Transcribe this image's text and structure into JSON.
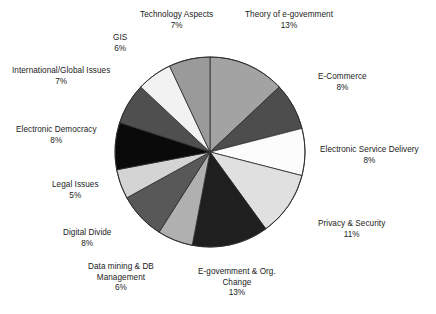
{
  "chart_data": {
    "type": "pie",
    "title": "",
    "subtitle": "",
    "xlabel": "",
    "ylabel": "",
    "legend_position": "none",
    "grid": false,
    "units": "percent",
    "start_angle_deg": 0,
    "direction": "clockwise",
    "categories": [
      "Theory of e-govemment",
      "E-Commerce",
      "Electronic Service Delivery",
      "Privacy & Security",
      "E-govemment & Org. Change",
      "Data mining & DB Management",
      "Digital Divide",
      "Legal Issues",
      "Electronic Democracy",
      "International/Global Issues",
      "GIS",
      "Technology Aspects"
    ],
    "values": [
      13,
      8,
      8,
      11,
      13,
      6,
      8,
      5,
      8,
      7,
      6,
      7
    ],
    "value_labels": [
      "13%",
      "8%",
      "8%",
      "11%",
      "13%",
      "6%",
      "8%",
      "5%",
      "8%",
      "7%",
      "6%",
      "7%"
    ],
    "colors": [
      "#a3a3a3",
      "#4d4d4d",
      "#fcfcfc",
      "#e0e0e0",
      "#1f1f1f",
      "#b0b0b0",
      "#585858",
      "#d4d4d4",
      "#0a0a0a",
      "#4f4f4f",
      "#f2f2f2",
      "#9a9a9a"
    ],
    "slice_border_color": "#2b2b2b",
    "slices": [
      {
        "name": "Theory of e-govemment",
        "value": 13,
        "value_label": "13%",
        "color": "#a3a3a3",
        "label_line1": "Theory of e-govemment",
        "label_line2": "13%"
      },
      {
        "name": "E-Commerce",
        "value": 8,
        "value_label": "8%",
        "color": "#4d4d4d",
        "label_line1": "E-Commerce",
        "label_line2": "8%"
      },
      {
        "name": "Electronic Service Delivery",
        "value": 8,
        "value_label": "8%",
        "color": "#fcfcfc",
        "label_line1": "Electronic Service Delivery",
        "label_line2": "8%"
      },
      {
        "name": "Privacy & Security",
        "value": 11,
        "value_label": "11%",
        "color": "#e0e0e0",
        "label_line1": "Privacy & Security",
        "label_line2": "11%"
      },
      {
        "name": "E-govemment & Org. Change",
        "value": 13,
        "value_label": "13%",
        "color": "#1f1f1f",
        "label_line1": "E-govemment & Org.",
        "label_line2": "Change",
        "label_line3": "13%"
      },
      {
        "name": "Data mining & DB Management",
        "value": 6,
        "value_label": "6%",
        "color": "#b0b0b0",
        "label_line1": "Data mining & DB",
        "label_line2": "Management",
        "label_line3": "6%"
      },
      {
        "name": "Digital Divide",
        "value": 8,
        "value_label": "8%",
        "color": "#585858",
        "label_line1": "Digital Divide",
        "label_line2": "8%"
      },
      {
        "name": "Legal Issues",
        "value": 5,
        "value_label": "5%",
        "color": "#d4d4d4",
        "label_line1": "Legal Issues",
        "label_line2": "5%"
      },
      {
        "name": "Electronic Democracy",
        "value": 8,
        "value_label": "8%",
        "color": "#0a0a0a",
        "label_line1": "Electronic Democracy",
        "label_line2": "8%"
      },
      {
        "name": "International/Global Issues",
        "value": 7,
        "value_label": "7%",
        "color": "#4f4f4f",
        "label_line1": "International/Global Issues",
        "label_line2": "7%"
      },
      {
        "name": "GIS",
        "value": 6,
        "value_label": "6%",
        "color": "#f2f2f2",
        "label_line1": "GIS",
        "label_line2": "6%"
      },
      {
        "name": "Technology Aspects",
        "value": 7,
        "value_label": "7%",
        "color": "#9a9a9a",
        "label_line1": "Technology Aspects",
        "label_line2": "7%"
      }
    ]
  },
  "labels": {
    "theory": {
      "name": "Theory of e-govemment",
      "value": "13%"
    },
    "ecommerce": {
      "name": "E-Commerce",
      "value": "8%"
    },
    "esd": {
      "name": "Electronic Service Delivery",
      "value": "8%"
    },
    "privacy": {
      "name": "Privacy & Security",
      "value": "11%"
    },
    "egovorg": {
      "name_line1": "E-govemment & Org.",
      "name_line2": "Change",
      "value": "13%"
    },
    "datamining": {
      "name_line1": "Data mining & DB",
      "name_line2": "Management",
      "value": "6%"
    },
    "digitaldivide": {
      "name": "Digital Divide",
      "value": "8%"
    },
    "legal": {
      "name": "Legal Issues",
      "value": "5%"
    },
    "edemocracy": {
      "name": "Electronic Democracy",
      "value": "8%"
    },
    "international": {
      "name": "International/Global Issues",
      "value": "7%"
    },
    "gis": {
      "name": "GIS",
      "value": "6%"
    },
    "techaspects": {
      "name": "Technology Aspects",
      "value": "7%"
    }
  }
}
